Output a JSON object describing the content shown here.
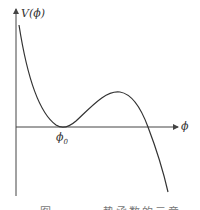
{
  "figure": {
    "y_axis_label": "V(ϕ)",
    "x_axis_label": "ϕ",
    "min_label_base": "ϕ",
    "min_label_sub": "0",
    "caption": "图 ．．．．．势函数的示意"
  },
  "colors": {
    "axis": "#444444",
    "curve": "#333333",
    "background": "#ffffff"
  }
}
